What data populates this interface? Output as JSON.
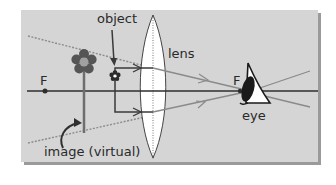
{
  "diagram": {
    "labels": {
      "object": "object",
      "lens": "lens",
      "focal_left": "F",
      "focal_right": "F",
      "eye": "eye",
      "image": "image (virtual)"
    },
    "colors": {
      "panel": "#d5d5d5",
      "panel_shadow": "#9a9a9a",
      "axis": "#2e2e2e",
      "ray_dark": "#3a3a3a",
      "ray_gray": "#8a8a8a",
      "ray_dotted": "#8c8c8c",
      "lens_fill": "#ffffff",
      "flower_petal": "#555555",
      "flower_center": "#a0a0a0",
      "stem": "#6e6e6e",
      "eye": "#1a1a1a"
    }
  }
}
